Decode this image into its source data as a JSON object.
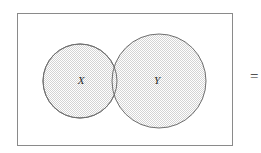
{
  "figure": {
    "kind": "venn-diagram",
    "width": 261,
    "height": 153,
    "background_color": "#ffffff"
  },
  "universe": {
    "name": "universal-set-rectangle",
    "x": 17,
    "y": 13,
    "width": 216,
    "height": 133,
    "border_color": "#8a8a8a",
    "border_width": 1,
    "fill_color": "#ffffff",
    "label": ""
  },
  "sets": [
    {
      "id": "X",
      "label": "X",
      "cx": 80,
      "cy": 81,
      "r": 37,
      "stroke_color": "#6f6f6f",
      "stroke_width": 1,
      "fill_pattern": "light-gray-hatch",
      "fill_color": "#e2e2e2",
      "label_x": 81,
      "label_y": 81
    },
    {
      "id": "Y",
      "label": "Y",
      "cx": 159,
      "cy": 81,
      "r": 47,
      "stroke_color": "#6f6f6f",
      "stroke_width": 1,
      "fill_pattern": "light-gray-hatch",
      "fill_color": "#e2e2e2",
      "label_x": 157,
      "label_y": 81
    }
  ],
  "overlap": {
    "name": "intersection-region",
    "shaded": true,
    "fill_pattern": "light-gray-hatch"
  },
  "annotations": [
    {
      "id": "equals",
      "text": "=",
      "x": 250,
      "y": 78,
      "clipped": true
    }
  ],
  "colors": {
    "stroke": "#6f6f6f",
    "frame": "#8a8a8a",
    "hatch": "#d6d6d6",
    "text": "#2b2b2b",
    "background": "#ffffff"
  }
}
